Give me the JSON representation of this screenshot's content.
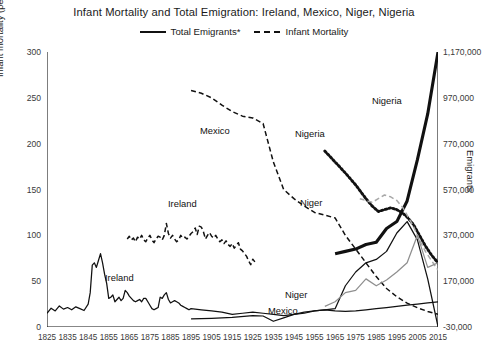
{
  "chart_data": {
    "type": "line",
    "title": "Infant Mortality and Total Emigration: Ireland, Mexico, Niger, Nigeria",
    "xlabel": "",
    "ylabel": "Infant mortality (per 1,000 live births)",
    "y2label": "Emigrants",
    "grid": false,
    "legend_position": "top-center",
    "legend": [
      {
        "label": "Total Emigrants*",
        "style": "solid"
      },
      {
        "label": "Infant Mortality",
        "style": "dashed"
      }
    ],
    "xlim": [
      1825,
      2015
    ],
    "ylim": [
      0,
      300
    ],
    "y2lim": [
      -30000,
      1170000
    ],
    "xticks": [
      1825,
      1835,
      1845,
      1855,
      1865,
      1875,
      1885,
      1895,
      1905,
      1915,
      1925,
      1935,
      1945,
      1955,
      1965,
      1975,
      1985,
      1995,
      2005,
      2015
    ],
    "yticks": [
      0,
      50,
      100,
      150,
      200,
      250,
      300
    ],
    "y2ticks": [
      -30000,
      170000,
      370000,
      570000,
      770000,
      970000,
      1170000
    ],
    "y2ticklabels": [
      "-30,000",
      "170,000",
      "370,000",
      "570,000",
      "770,000",
      "970,000",
      "1,170,000"
    ],
    "annotations": [
      {
        "text": "Ireland",
        "x": 1877,
        "axis": "mortality"
      },
      {
        "text": "Ireland",
        "x": 1856,
        "axis": "emigrants"
      },
      {
        "text": "Mexico",
        "x": 1903,
        "axis": "mortality"
      },
      {
        "text": "Mexico",
        "x": 1955,
        "axis": "emigrants"
      },
      {
        "text": "Nigeria",
        "x": 1972,
        "axis": "mortality"
      },
      {
        "text": "Nigeria",
        "x": 2000,
        "axis": "emigrants"
      },
      {
        "text": "Niger",
        "x": 1979,
        "axis": "mortality"
      },
      {
        "text": "Niger",
        "x": 1971,
        "axis": "emigrants"
      }
    ],
    "series": [
      {
        "name": "Ireland Infant Mortality",
        "axis": "mortality",
        "style": "dashed",
        "color": "#111111",
        "points": [
          [
            1864,
            96
          ],
          [
            1865,
            99
          ],
          [
            1866,
            95
          ],
          [
            1867,
            97
          ],
          [
            1868,
            93
          ],
          [
            1869,
            98
          ],
          [
            1870,
            96
          ],
          [
            1871,
            100
          ],
          [
            1872,
            95
          ],
          [
            1873,
            93
          ],
          [
            1874,
            97
          ],
          [
            1875,
            100
          ],
          [
            1876,
            95
          ],
          [
            1877,
            92
          ],
          [
            1878,
            96
          ],
          [
            1879,
            99
          ],
          [
            1880,
            98
          ],
          [
            1881,
            95
          ],
          [
            1882,
            100
          ],
          [
            1883,
            113
          ],
          [
            1884,
            102
          ],
          [
            1885,
            97
          ],
          [
            1886,
            100
          ],
          [
            1887,
            96
          ],
          [
            1888,
            93
          ],
          [
            1889,
            95
          ],
          [
            1890,
            100
          ],
          [
            1891,
            97
          ],
          [
            1892,
            98
          ],
          [
            1893,
            96
          ],
          [
            1894,
            99
          ],
          [
            1895,
            102
          ],
          [
            1896,
            104
          ],
          [
            1897,
            108
          ],
          [
            1898,
            101
          ],
          [
            1899,
            110
          ],
          [
            1900,
            109
          ],
          [
            1901,
            104
          ],
          [
            1902,
            96
          ],
          [
            1903,
            100
          ],
          [
            1904,
            103
          ],
          [
            1905,
            99
          ],
          [
            1906,
            97
          ],
          [
            1907,
            100
          ],
          [
            1908,
            96
          ],
          [
            1909,
            93
          ],
          [
            1910,
            95
          ],
          [
            1911,
            91
          ],
          [
            1912,
            94
          ],
          [
            1913,
            90
          ],
          [
            1914,
            88
          ],
          [
            1915,
            91
          ],
          [
            1916,
            86
          ],
          [
            1917,
            89
          ],
          [
            1918,
            92
          ],
          [
            1919,
            85
          ],
          [
            1920,
            83
          ],
          [
            1921,
            80
          ],
          [
            1922,
            77
          ],
          [
            1923,
            72
          ],
          [
            1924,
            68
          ],
          [
            1925,
            74
          ],
          [
            1926,
            71
          ]
        ]
      },
      {
        "name": "Ireland Total Emigrants",
        "axis": "emigrants",
        "style": "solid",
        "color": "#111111",
        "points": [
          [
            1825,
            30000
          ],
          [
            1827,
            52000
          ],
          [
            1829,
            40000
          ],
          [
            1831,
            62000
          ],
          [
            1833,
            48000
          ],
          [
            1835,
            55000
          ],
          [
            1837,
            45000
          ],
          [
            1839,
            58000
          ],
          [
            1841,
            50000
          ],
          [
            1843,
            42000
          ],
          [
            1845,
            70000
          ],
          [
            1846,
            120000
          ],
          [
            1847,
            240000
          ],
          [
            1848,
            250000
          ],
          [
            1849,
            230000
          ],
          [
            1850,
            260000
          ],
          [
            1851,
            290000
          ],
          [
            1852,
            250000
          ],
          [
            1853,
            200000
          ],
          [
            1854,
            160000
          ],
          [
            1855,
            95000
          ],
          [
            1856,
            100000
          ],
          [
            1857,
            110000
          ],
          [
            1858,
            80000
          ],
          [
            1859,
            90000
          ],
          [
            1860,
            100000
          ],
          [
            1861,
            85000
          ],
          [
            1862,
            95000
          ],
          [
            1863,
            130000
          ],
          [
            1864,
            120000
          ],
          [
            1865,
            105000
          ],
          [
            1866,
            95000
          ],
          [
            1867,
            85000
          ],
          [
            1868,
            80000
          ],
          [
            1869,
            85000
          ],
          [
            1870,
            90000
          ],
          [
            1871,
            80000
          ],
          [
            1872,
            95000
          ],
          [
            1873,
            95000
          ],
          [
            1874,
            80000
          ],
          [
            1875,
            65000
          ],
          [
            1876,
            50000
          ],
          [
            1877,
            45000
          ],
          [
            1878,
            50000
          ],
          [
            1879,
            55000
          ],
          [
            1880,
            100000
          ],
          [
            1881,
            95000
          ],
          [
            1882,
            110000
          ],
          [
            1883,
            120000
          ],
          [
            1884,
            90000
          ],
          [
            1885,
            75000
          ],
          [
            1886,
            80000
          ],
          [
            1887,
            85000
          ],
          [
            1888,
            80000
          ],
          [
            1889,
            75000
          ],
          [
            1890,
            65000
          ],
          [
            1891,
            60000
          ],
          [
            1892,
            55000
          ],
          [
            1893,
            50000
          ],
          [
            1894,
            45000
          ],
          [
            1895,
            50000
          ],
          [
            1900,
            45000
          ],
          [
            1905,
            40000
          ],
          [
            1910,
            35000
          ],
          [
            1915,
            25000
          ],
          [
            1920,
            30000
          ],
          [
            1925,
            35000
          ],
          [
            1930,
            30000
          ],
          [
            1935,
            25000
          ],
          [
            1940,
            20000
          ],
          [
            1945,
            25000
          ],
          [
            1950,
            30000
          ],
          [
            1955,
            40000
          ],
          [
            1960,
            45000
          ],
          [
            1965,
            40000
          ],
          [
            1970,
            38000
          ],
          [
            1975,
            40000
          ],
          [
            1980,
            45000
          ],
          [
            1985,
            50000
          ],
          [
            1990,
            55000
          ],
          [
            1995,
            60000
          ],
          [
            2000,
            65000
          ],
          [
            2005,
            70000
          ],
          [
            2010,
            75000
          ],
          [
            2015,
            80000
          ]
        ]
      },
      {
        "name": "Mexico Infant Mortality",
        "axis": "mortality",
        "style": "dashed",
        "color": "#111111",
        "points": [
          [
            1895,
            258
          ],
          [
            1900,
            255
          ],
          [
            1905,
            250
          ],
          [
            1910,
            242
          ],
          [
            1915,
            235
          ],
          [
            1920,
            230
          ],
          [
            1925,
            228
          ],
          [
            1930,
            222
          ],
          [
            1935,
            180
          ],
          [
            1940,
            150
          ],
          [
            1945,
            140
          ],
          [
            1950,
            132
          ],
          [
            1955,
            125
          ],
          [
            1960,
            122
          ],
          [
            1965,
            119
          ],
          [
            1970,
            100
          ],
          [
            1975,
            85
          ],
          [
            1980,
            70
          ],
          [
            1985,
            55
          ],
          [
            1990,
            42
          ],
          [
            1995,
            33
          ],
          [
            2000,
            26
          ],
          [
            2005,
            21
          ],
          [
            2010,
            17
          ],
          [
            2015,
            14
          ]
        ]
      },
      {
        "name": "Mexico Total Emigrants",
        "axis": "emigrants",
        "style": "solid",
        "color": "#111111",
        "points": [
          [
            1895,
            5000
          ],
          [
            1905,
            8000
          ],
          [
            1915,
            12000
          ],
          [
            1925,
            20000
          ],
          [
            1930,
            18000
          ],
          [
            1935,
            -5000
          ],
          [
            1940,
            10000
          ],
          [
            1945,
            25000
          ],
          [
            1950,
            35000
          ],
          [
            1955,
            40000
          ],
          [
            1960,
            45000
          ],
          [
            1965,
            50000
          ],
          [
            1970,
            150000
          ],
          [
            1975,
            210000
          ],
          [
            1980,
            250000
          ],
          [
            1985,
            265000
          ],
          [
            1990,
            300000
          ],
          [
            1995,
            380000
          ],
          [
            2000,
            430000
          ],
          [
            2005,
            350000
          ],
          [
            2010,
            180000
          ],
          [
            2015,
            -28000
          ]
        ]
      },
      {
        "name": "Nigeria Infant Mortality",
        "axis": "mortality",
        "style": "dotted",
        "color": "#111111",
        "points": [
          [
            1960,
            192
          ],
          [
            1965,
            180
          ],
          [
            1970,
            168
          ],
          [
            1975,
            155
          ],
          [
            1980,
            140
          ],
          [
            1983,
            132
          ],
          [
            1986,
            126
          ],
          [
            1989,
            128
          ],
          [
            1992,
            130
          ],
          [
            1995,
            128
          ],
          [
            1998,
            124
          ],
          [
            2000,
            120
          ],
          [
            2003,
            112
          ],
          [
            2006,
            100
          ],
          [
            2009,
            88
          ],
          [
            2012,
            78
          ],
          [
            2015,
            70
          ]
        ]
      },
      {
        "name": "Nigeria Total Emigrants",
        "axis": "emigrants",
        "style": "solid-thick",
        "color": "#111111",
        "points": [
          [
            1965,
            290000
          ],
          [
            1970,
            300000
          ],
          [
            1975,
            310000
          ],
          [
            1980,
            330000
          ],
          [
            1985,
            340000
          ],
          [
            1990,
            400000
          ],
          [
            1995,
            430000
          ],
          [
            2000,
            520000
          ],
          [
            2005,
            700000
          ],
          [
            2010,
            900000
          ],
          [
            2015,
            1170000
          ]
        ]
      },
      {
        "name": "Niger Infant Mortality",
        "axis": "mortality",
        "style": "dashed",
        "color": "#a8a8a8",
        "points": [
          [
            1977,
            140
          ],
          [
            1980,
            138
          ],
          [
            1983,
            136
          ],
          [
            1986,
            140
          ],
          [
            1989,
            144
          ],
          [
            1992,
            142
          ],
          [
            1995,
            138
          ],
          [
            1998,
            130
          ],
          [
            2000,
            122
          ],
          [
            2003,
            110
          ],
          [
            2006,
            95
          ],
          [
            2009,
            82
          ],
          [
            2012,
            72
          ],
          [
            2015,
            62
          ]
        ]
      },
      {
        "name": "Niger Total Emigrants",
        "axis": "emigrants",
        "style": "solid",
        "color": "#8f8f8f",
        "points": [
          [
            1960,
            60000
          ],
          [
            1965,
            80000
          ],
          [
            1970,
            120000
          ],
          [
            1975,
            130000
          ],
          [
            1980,
            180000
          ],
          [
            1985,
            150000
          ],
          [
            1990,
            175000
          ],
          [
            1995,
            210000
          ],
          [
            2000,
            250000
          ],
          [
            2005,
            370000
          ],
          [
            2010,
            230000
          ],
          [
            2015,
            250000
          ]
        ]
      }
    ]
  }
}
